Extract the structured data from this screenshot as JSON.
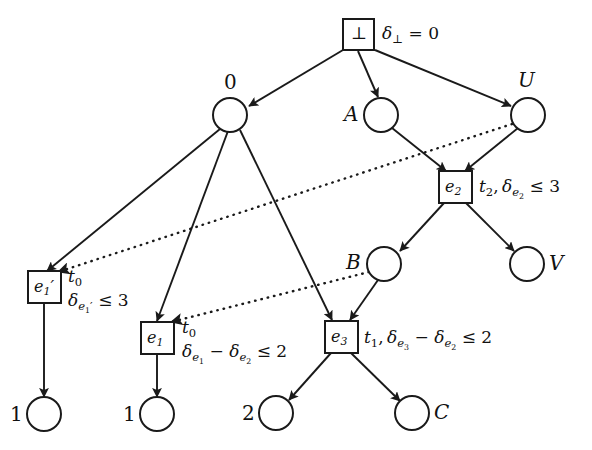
{
  "diagram": {
    "type": "event-structure-graph",
    "title": "",
    "colors": {
      "stroke": "#1a1a1a",
      "background": "#ffffff",
      "text": "#111111"
    },
    "nodes": [
      {
        "id": "bot",
        "shape": "box",
        "inner": "⊥",
        "label": "",
        "label_pos": "none",
        "x": 358,
        "y": 34
      },
      {
        "id": "n0",
        "shape": "circle",
        "inner": "",
        "label": "0",
        "label_pos": "above",
        "x": 230,
        "y": 115
      },
      {
        "id": "nA",
        "shape": "circle",
        "inner": "",
        "label": "A",
        "label_pos": "left",
        "x": 381,
        "y": 115
      },
      {
        "id": "nU",
        "shape": "circle",
        "inner": "",
        "label": "U",
        "label_pos": "above",
        "x": 528,
        "y": 115
      },
      {
        "id": "e2",
        "shape": "box",
        "inner": "e2",
        "label": "",
        "label_pos": "none",
        "x": 455,
        "y": 187
      },
      {
        "id": "nB",
        "shape": "circle",
        "inner": "",
        "label": "B",
        "label_pos": "left",
        "x": 384,
        "y": 264
      },
      {
        "id": "nV",
        "shape": "circle",
        "inner": "",
        "label": "V",
        "label_pos": "right",
        "x": 527,
        "y": 264
      },
      {
        "id": "e1p",
        "shape": "box",
        "inner": "e1'",
        "label": "",
        "label_pos": "none",
        "x": 44,
        "y": 287
      },
      {
        "id": "e1",
        "shape": "box",
        "inner": "e1",
        "label": "",
        "label_pos": "none",
        "x": 158,
        "y": 338
      },
      {
        "id": "e3",
        "shape": "box",
        "inner": "e3",
        "label": "",
        "label_pos": "none",
        "x": 341,
        "y": 337
      },
      {
        "id": "l1a",
        "shape": "circle",
        "inner": "",
        "label": "1",
        "label_pos": "left",
        "x": 44,
        "y": 414
      },
      {
        "id": "l1b",
        "shape": "circle",
        "inner": "",
        "label": "1",
        "label_pos": "left",
        "x": 157,
        "y": 414
      },
      {
        "id": "l2",
        "shape": "circle",
        "inner": "",
        "label": "2",
        "label_pos": "left",
        "x": 276,
        "y": 413
      },
      {
        "id": "lC",
        "shape": "circle",
        "inner": "",
        "label": "C",
        "label_pos": "right",
        "x": 412,
        "y": 413
      }
    ],
    "edges": [
      {
        "from": "bot",
        "to": "n0",
        "style": "solid"
      },
      {
        "from": "bot",
        "to": "nA",
        "style": "solid"
      },
      {
        "from": "bot",
        "to": "nU",
        "style": "solid"
      },
      {
        "from": "n0",
        "to": "e1p",
        "style": "solid"
      },
      {
        "from": "n0",
        "to": "e1",
        "style": "solid"
      },
      {
        "from": "n0",
        "to": "e3",
        "style": "solid"
      },
      {
        "from": "nA",
        "to": "e2",
        "style": "solid"
      },
      {
        "from": "nU",
        "to": "e2",
        "style": "solid"
      },
      {
        "from": "e2",
        "to": "nB",
        "style": "solid"
      },
      {
        "from": "e2",
        "to": "nV",
        "style": "solid"
      },
      {
        "from": "nB",
        "to": "e3",
        "style": "solid"
      },
      {
        "from": "e1p",
        "to": "l1a",
        "style": "solid"
      },
      {
        "from": "e1",
        "to": "l1b",
        "style": "solid"
      },
      {
        "from": "e3",
        "to": "l2",
        "style": "solid"
      },
      {
        "from": "e3",
        "to": "lC",
        "style": "solid"
      },
      {
        "from": "nU",
        "to": "e1p",
        "style": "dotted"
      },
      {
        "from": "nB",
        "to": "e1",
        "style": "dotted"
      }
    ],
    "annotations": [
      {
        "id": "bot-delta",
        "for": "bot",
        "text": "δ⊥ = 0",
        "x": 385,
        "y": 22
      },
      {
        "id": "e2-cons",
        "for": "e2",
        "text": "t₂, δe₂ ≤ 3",
        "x": 482,
        "y": 177
      },
      {
        "id": "e1p-t",
        "for": "e1p",
        "text": "t₀",
        "x": 66,
        "y": 266
      },
      {
        "id": "e1p-cons",
        "for": "e1p",
        "text": "δe₁' ≤ 3",
        "x": 66,
        "y": 290
      },
      {
        "id": "e1-t",
        "for": "e1",
        "text": "t₀",
        "x": 180,
        "y": 317
      },
      {
        "id": "e1-cons",
        "for": "e1",
        "text": "δe₁ − δe₂ ≤ 2",
        "x": 180,
        "y": 341
      },
      {
        "id": "e3-cons",
        "for": "e3",
        "text": "t₁, δe₃ − δe₂ ≤ 2",
        "x": 365,
        "y": 327
      }
    ]
  }
}
